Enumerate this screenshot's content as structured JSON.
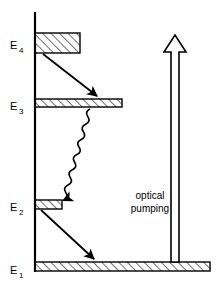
{
  "figure": {
    "type": "energy-level-diagram",
    "title": "",
    "background_color": "#ffffff",
    "stroke_color": "#000000",
    "width": 223,
    "height": 285
  },
  "axis": {
    "name": "energy-axis",
    "orientation": "vertical",
    "x": 35,
    "y_top": 12,
    "y_bottom": 272
  },
  "levels": [
    {
      "id": "E4",
      "label": "E",
      "subscript": "4",
      "label_x": 10,
      "label_y": 48,
      "bar": {
        "x": 35,
        "y": 33,
        "width": 45,
        "height": 20,
        "style": "hatched-box"
      }
    },
    {
      "id": "E3",
      "label": "E",
      "subscript": "3",
      "label_x": 10,
      "label_y": 110,
      "bar": {
        "x": 35,
        "y": 99,
        "width": 87,
        "height": 8,
        "style": "hatched-bar"
      }
    },
    {
      "id": "E2",
      "label": "E",
      "subscript": "2",
      "label_x": 10,
      "label_y": 210,
      "bar": {
        "x": 35,
        "y": 200,
        "width": 27,
        "height": 9,
        "style": "hatched-bar"
      }
    },
    {
      "id": "E1",
      "label": "E",
      "subscript": "1",
      "label_x": 10,
      "label_y": 275,
      "bar": {
        "x": 35,
        "y": 262,
        "width": 175,
        "height": 9,
        "style": "hatched-bar"
      }
    }
  ],
  "transitions": [
    {
      "name": "e4-to-e3-decay",
      "kind": "straight-arrow",
      "from": "E4",
      "to": "E3",
      "x1": 43,
      "y1": 54,
      "x2": 99,
      "y2": 98
    },
    {
      "name": "e3-to-e2-nonradiative",
      "kind": "wavy-arrow",
      "from": "E3",
      "to": "E2",
      "x1": 90,
      "y1": 108,
      "x2": 47,
      "y2": 198
    },
    {
      "name": "e2-to-e1-laser",
      "kind": "straight-arrow",
      "from": "E2",
      "to": "E1",
      "x1": 41,
      "y1": 210,
      "x2": 96,
      "y2": 261
    }
  ],
  "pump": {
    "name": "optical-pumping-arrow",
    "kind": "hollow-block-arrow",
    "direction": "up",
    "shaft_x": 175,
    "shaft_half_width": 4,
    "head_half_width": 11,
    "y_base": 262,
    "y_head_base": 52,
    "y_tip": 35,
    "label_line1": "optical",
    "label_line2": "pumping",
    "label_x": 150,
    "label_y1": 199,
    "label_y2": 211
  }
}
